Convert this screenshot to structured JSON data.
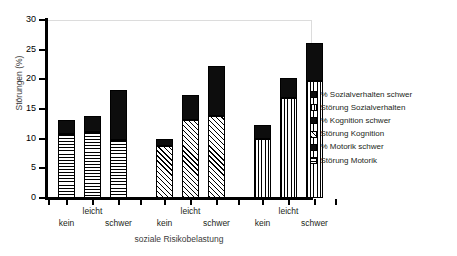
{
  "chart_data": {
    "type": "bar",
    "subtype": "grouped-stacked-bar",
    "title": "",
    "xlabel": "soziale Risikobelastung",
    "ylabel": "Störungen (%)",
    "ylim": [
      0,
      30
    ],
    "ytick_labels": [
      "0",
      "5",
      "10",
      "15",
      "20",
      "25",
      "30"
    ],
    "ytick_values": [
      0,
      5,
      10,
      15,
      20,
      25,
      30
    ],
    "grid": false,
    "legend_position": "right",
    "categories": [
      "kein",
      "leicht",
      "schwer"
    ],
    "groups": [
      {
        "name": "Motorik",
        "pattern": "horizontal-lines",
        "categories": [
          "kein",
          "leicht",
          "schwer"
        ],
        "stoerung_values": [
          10.8,
          11.1,
          9.8
        ],
        "schwer_values": [
          2.4,
          2.7,
          8.4
        ],
        "totals": [
          13.2,
          13.8,
          18.2
        ]
      },
      {
        "name": "Kognition",
        "pattern": "diagonal-hatch",
        "categories": [
          "kein",
          "leicht",
          "schwer"
        ],
        "stoerung_values": [
          8.8,
          13.1,
          13.9
        ],
        "schwer_values": [
          1.2,
          4.3,
          8.3
        ],
        "totals": [
          10.0,
          17.4,
          22.2
        ]
      },
      {
        "name": "Sozialverhalten",
        "pattern": "vertical-lines",
        "categories": [
          "kein",
          "leicht",
          "schwer"
        ],
        "stoerung_values": [
          10.0,
          16.9,
          19.8
        ],
        "schwer_values": [
          2.3,
          3.4,
          6.4
        ],
        "totals": [
          12.3,
          20.3,
          26.2
        ]
      }
    ],
    "legend": [
      {
        "label": "% Sozialverhalten schwer",
        "swatch": "solid-black"
      },
      {
        "label": "Störung Sozialverhalten",
        "swatch": "vertical-lines"
      },
      {
        "label": "% Kognition schwer",
        "swatch": "solid-black"
      },
      {
        "label": "Störung Kognition",
        "swatch": "diagonal-hatch"
      },
      {
        "label": "% Motorik schwer",
        "swatch": "solid-black"
      },
      {
        "label": "Störung Motorik",
        "swatch": "horizontal-lines"
      }
    ],
    "xtick_labels": [
      "kein",
      "leicht",
      "schwer",
      "kein",
      "leicht",
      "schwer",
      "kein",
      "leicht",
      "schwer"
    ]
  }
}
